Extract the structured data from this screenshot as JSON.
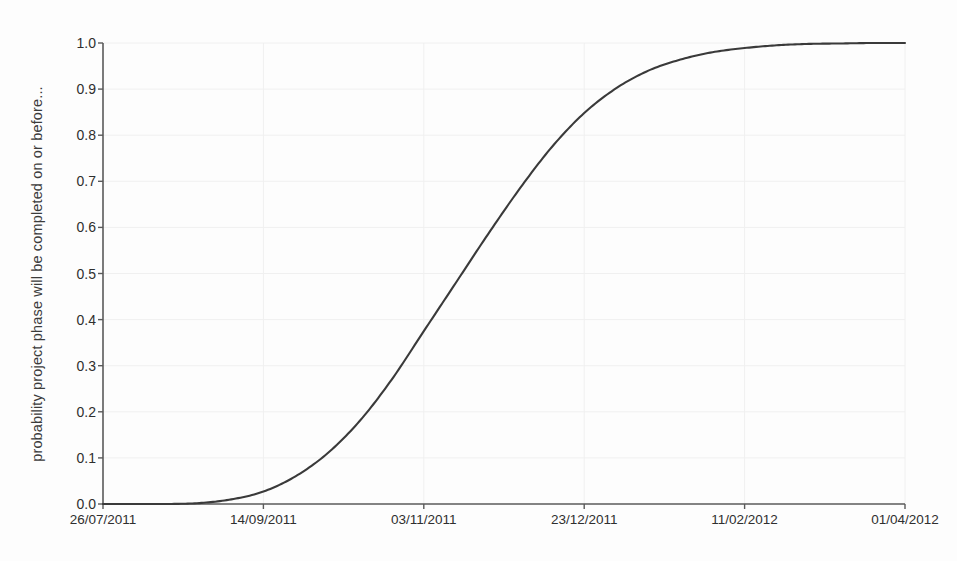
{
  "chart_data": {
    "type": "line",
    "title": "",
    "subtitle": "",
    "xlabel": "",
    "ylabel": "probability project phase will be completed on or before...",
    "ylim": [
      0.0,
      1.0
    ],
    "yticks": [
      "0.0",
      "0.1",
      "0.2",
      "0.3",
      "0.4",
      "0.5",
      "0.6",
      "0.7",
      "0.8",
      "0.9",
      "1.0"
    ],
    "ytick_values": [
      0.0,
      0.1,
      0.2,
      0.3,
      0.4,
      0.5,
      0.6,
      0.7,
      0.8,
      0.9,
      1.0
    ],
    "xticks": [
      "26/07/2011",
      "14/09/2011",
      "03/11/2011",
      "23/12/2011",
      "11/02/2012",
      "01/04/2012"
    ],
    "grid": true,
    "legend": "none",
    "line_color": "#3a3a3a",
    "grid_color": "#f0f0f0",
    "axis_color": "#5a5a5a",
    "background_color": "#fdfdfd",
    "series": [
      {
        "name": "cumulative completion probability",
        "x": [
          "26/07/2011",
          "05/08/2011",
          "15/08/2011",
          "25/08/2011",
          "04/09/2011",
          "14/09/2011",
          "24/09/2011",
          "04/10/2011",
          "14/10/2011",
          "24/10/2011",
          "03/11/2011",
          "13/11/2011",
          "23/11/2011",
          "03/12/2011",
          "13/12/2011",
          "23/12/2011",
          "02/01/2012",
          "12/01/2012",
          "22/01/2012",
          "01/02/2012",
          "11/02/2012",
          "21/02/2012",
          "02/03/2012",
          "12/03/2012",
          "22/03/2012",
          "01/04/2012"
        ],
        "values": [
          0.0,
          0.0,
          0.0,
          0.002,
          0.01,
          0.027,
          0.06,
          0.11,
          0.18,
          0.27,
          0.375,
          0.48,
          0.585,
          0.685,
          0.775,
          0.848,
          0.902,
          0.94,
          0.964,
          0.98,
          0.989,
          0.995,
          0.998,
          0.999,
          1.0,
          1.0
        ]
      }
    ]
  },
  "plot_geometry": {
    "left": 103,
    "right": 905,
    "top": 43,
    "bottom": 504
  }
}
